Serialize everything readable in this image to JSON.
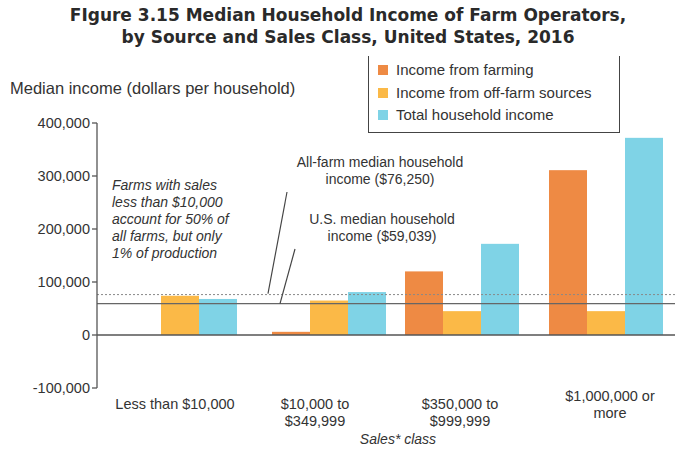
{
  "title": {
    "line1": "FIgure 3.15 Median Household Income of Farm Operators,",
    "line2": "by Source and Sales Class, United States, 2016"
  },
  "colors": {
    "farming": "#ee8a44",
    "off_farm": "#fbb947",
    "total": "#7fd3e6",
    "axis": "#555555",
    "ref_line": "#666666"
  },
  "legend": {
    "items": [
      {
        "label": "Income from farming",
        "color": "#ee8a44"
      },
      {
        "label": "Income from off-farm sources",
        "color": "#fbb947"
      },
      {
        "label": "Total household income",
        "color": "#7fd3e6"
      }
    ]
  },
  "annotations": {
    "small_farms_note": [
      "Farms with sales",
      "less than $10,000",
      "account for 50% of",
      "all farms, but only",
      "1% of production"
    ],
    "all_farm_median": [
      "All-farm median household",
      "income ($76,250)"
    ],
    "us_median": [
      "U.S. median household",
      "income ($59,039)"
    ]
  },
  "chart_data": {
    "type": "bar",
    "title": "FIgure 3.15 Median Household Income of Farm Operators, by Source and Sales Class, United States, 2016",
    "xlabel": "Sales* class",
    "ylabel": "Median income (dollars per household)",
    "ylim": [
      -100000,
      400000
    ],
    "yticks": [
      400000,
      300000,
      200000,
      100000,
      0,
      -100000
    ],
    "ytick_labels": [
      "400,000",
      "300,000",
      "200,000",
      "100,000",
      "0",
      "-100,000"
    ],
    "categories": [
      "Less than $10,000",
      "$10,000 to $349,999",
      "$350,000 to $999,999",
      "$1,000,000 or more"
    ],
    "category_lines": [
      [
        "Less than $10,000"
      ],
      [
        "$10,000 to",
        "$349,999"
      ],
      [
        "$350,000 to",
        "$999,999"
      ],
      [
        "$1,000,000 or",
        "more"
      ]
    ],
    "series": [
      {
        "name": "Income from farming",
        "values": [
          0,
          6000,
          120000,
          311000
        ]
      },
      {
        "name": "Income from off-farm sources",
        "values": [
          74000,
          65000,
          45000,
          45000
        ]
      },
      {
        "name": "Total household income",
        "values": [
          68000,
          81000,
          172000,
          372000
        ]
      }
    ],
    "reference_lines": [
      {
        "label": "All-farm median household income ($76,250)",
        "value": 76250,
        "style": "dotted"
      },
      {
        "label": "U.S. median household income ($59,039)",
        "value": 59039,
        "style": "solid"
      }
    ],
    "grid": false,
    "legend_position": "top-right"
  }
}
